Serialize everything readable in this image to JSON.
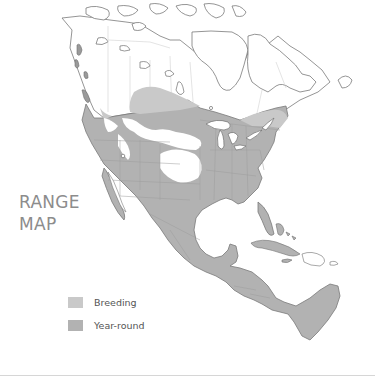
{
  "map": {
    "title_line1": "RANGE",
    "title_line2": "MAP",
    "region": "North America and Central America",
    "colors": {
      "breeding": "#c9c9c9",
      "year_round": "#b2b2b2",
      "outline": "#6e6e6e",
      "boundary": "#c4c4c4",
      "background": "#ffffff",
      "title_text": "#8c8c8c"
    }
  },
  "legend": {
    "items": [
      {
        "label": "Breeding",
        "color": "#c9c9c9"
      },
      {
        "label": "Year-round",
        "color": "#b2b2b2"
      }
    ]
  }
}
